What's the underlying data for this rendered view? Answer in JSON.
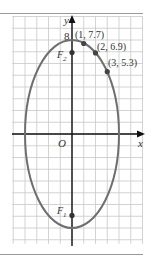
{
  "figure": {
    "axes": {
      "x_label": "x",
      "y_label": "y",
      "origin_label": "O",
      "y_tick_label": "8"
    },
    "ellipse": {
      "equation": "x^2/16 + y^2/64 = 1",
      "a_x": 4,
      "b_y": 8,
      "stroke": "#6e6e6e"
    },
    "points": [
      {
        "label": "(1, 7.7)",
        "x": 1,
        "y": 7.7
      },
      {
        "label": "(2, 6.9)",
        "x": 2,
        "y": 6.9
      },
      {
        "label": "(3, 5.3)",
        "x": 3,
        "y": 5.3
      }
    ],
    "foci": [
      {
        "label": "F",
        "sub": "2",
        "x": 0,
        "y": 6.93
      },
      {
        "label": "F",
        "sub": "1",
        "x": 0,
        "y": -6.93
      }
    ],
    "grid": {
      "x_min": -5,
      "x_max": 6,
      "y_min": -9,
      "y_max": 10,
      "color": "#c8c8c8"
    }
  }
}
